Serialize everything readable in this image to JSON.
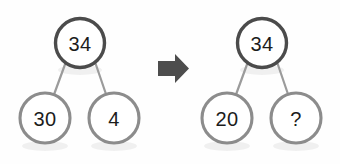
{
  "diagram": {
    "background_color": "#fefefe",
    "root_stroke_color": "#4b4b4b",
    "child_stroke_color": "#8c8c8c",
    "edge_color": "#9b9b9b",
    "arrow_color": "#4d4d4d",
    "text_color": "#1c1c1c"
  },
  "left_tree": {
    "name": "original-number-bond",
    "root": {
      "label": "34"
    },
    "left_child": {
      "label": "30"
    },
    "right_child": {
      "label": "4"
    }
  },
  "arrow": {
    "icon": "right-arrow-icon",
    "label": "becomes"
  },
  "right_tree": {
    "name": "regrouped-number-bond",
    "root": {
      "label": "34"
    },
    "left_child": {
      "label": "20"
    },
    "right_child": {
      "label": "?"
    }
  }
}
